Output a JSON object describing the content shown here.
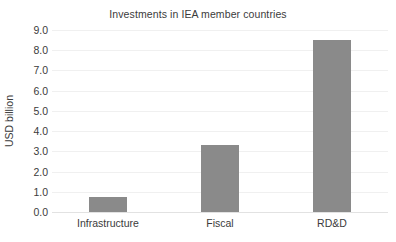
{
  "chart_data": {
    "type": "bar",
    "title": "Investments in IEA member countries",
    "xlabel": "",
    "ylabel": "USD billion",
    "categories": [
      "Infrastructure",
      "Fiscal",
      "RD&D"
    ],
    "values": [
      0.75,
      3.3,
      8.5
    ],
    "ylim": [
      0.0,
      9.0
    ],
    "ytick_labels": [
      "9.0",
      "8.0",
      "7.0",
      "6.0",
      "5.0",
      "4.0",
      "3.0",
      "2.0",
      "1.0",
      "0.0"
    ],
    "ytick_values": [
      9.0,
      8.0,
      7.0,
      6.0,
      5.0,
      4.0,
      3.0,
      2.0,
      1.0,
      0.0
    ],
    "grid": true,
    "legend": false,
    "legend_position": "none",
    "series": [
      {
        "name": "Investments",
        "values": [
          0.75,
          3.3,
          8.5
        ],
        "color": "#8a8a8a"
      }
    ],
    "colors": {
      "bar": "#8a8a8a",
      "gridline": "#f0f0f0",
      "baseline": "#e2e2e2",
      "text": "#3b3b3b",
      "background": "#ffffff"
    }
  }
}
